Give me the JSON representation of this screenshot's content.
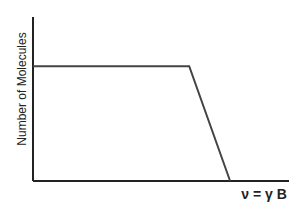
{
  "chart_data": {
    "type": "line",
    "title": "",
    "xlabel": "ν = γ B",
    "ylabel": "Number of Molecules",
    "grid": false,
    "legend": null,
    "x_ticks": [],
    "y_ticks": [],
    "series": [
      {
        "name": "distribution",
        "description": "Flat plateau then linear drop to zero, ending at the frequency marked ν = γ B",
        "points": [
          {
            "x": 0.0,
            "y": 0.7
          },
          {
            "x": 0.61,
            "y": 0.7
          },
          {
            "x": 0.77,
            "y": 0.0
          }
        ]
      }
    ],
    "xlim": [
      0,
      1
    ],
    "ylim": [
      0,
      1
    ],
    "colors": {
      "axis": "#222222",
      "line": "#444444",
      "background": "#ffffff"
    }
  },
  "labels": {
    "y_axis": "Number of Molecules",
    "x_axis": "ν = γ B"
  }
}
